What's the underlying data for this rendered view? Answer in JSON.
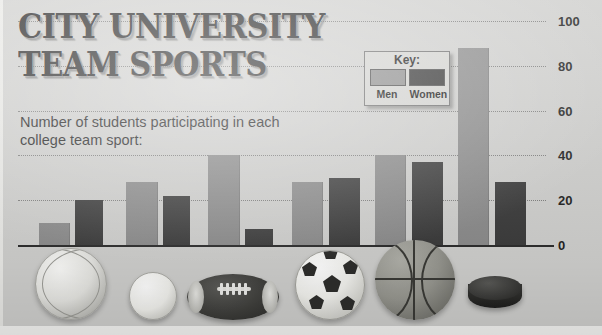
{
  "poster": {
    "title_line1": "City University",
    "title_line2": "Team Sports",
    "subtitle": "Number of students participating in each college team sport:"
  },
  "legend": {
    "title": "Key:",
    "men_label": "Men",
    "women_label": "Women",
    "men_color": "#8e8e8e",
    "women_color": "#343434"
  },
  "axis": {
    "tick_labels": [
      "100",
      "80",
      "60",
      "40",
      "20",
      "0"
    ]
  },
  "icons": [
    {
      "name": "volleyball-icon"
    },
    {
      "name": "baseball-icon"
    },
    {
      "name": "football-icon"
    },
    {
      "name": "soccer-ball-icon"
    },
    {
      "name": "basketball-icon"
    },
    {
      "name": "hockey-puck-icon"
    }
  ],
  "chart_data": {
    "type": "bar",
    "title": "City University Team Sports",
    "subtitle": "Number of students participating in each college team sport:",
    "xlabel": "",
    "ylabel": "",
    "ylim": [
      0,
      100
    ],
    "yticks": [
      0,
      20,
      40,
      60,
      80,
      100
    ],
    "grid": true,
    "legend_position": "top-right",
    "categories": [
      "Volleyball",
      "Baseball/Softball",
      "Football",
      "Soccer",
      "Basketball",
      "Ice hockey"
    ],
    "series": [
      {
        "name": "Men",
        "color": "#8b8b8b",
        "values": [
          10,
          28,
          40,
          28,
          40,
          88
        ]
      },
      {
        "name": "Women",
        "color": "#3b3b3b",
        "values": [
          20,
          22,
          7,
          30,
          37,
          28
        ]
      }
    ]
  },
  "bars": [
    {
      "group": "Volleyball",
      "series": "Men",
      "value": 10,
      "left": 21,
      "width": 31
    },
    {
      "group": "Volleyball",
      "series": "Women",
      "value": 20,
      "left": 57,
      "width": 28
    },
    {
      "group": "Baseball/Softball",
      "series": "Men",
      "value": 28,
      "left": 108,
      "width": 32
    },
    {
      "group": "Baseball/Softball",
      "series": "Women",
      "value": 22,
      "left": 145,
      "width": 27
    },
    {
      "group": "Football",
      "series": "Men",
      "value": 40,
      "left": 190,
      "width": 32
    },
    {
      "group": "Football",
      "series": "Women",
      "value": 7,
      "left": 227,
      "width": 28
    },
    {
      "group": "Soccer",
      "series": "Men",
      "value": 28,
      "left": 274,
      "width": 31
    },
    {
      "group": "Soccer",
      "series": "Women",
      "value": 30,
      "left": 311,
      "width": 31
    },
    {
      "group": "Basketball",
      "series": "Men",
      "value": 40,
      "left": 357,
      "width": 31
    },
    {
      "group": "Basketball",
      "series": "Women",
      "value": 37,
      "left": 394,
      "width": 31
    },
    {
      "group": "Ice hockey",
      "series": "Men",
      "value": 88,
      "left": 440,
      "width": 31
    },
    {
      "group": "Ice hockey",
      "series": "Women",
      "value": 28,
      "left": 477,
      "width": 31
    }
  ]
}
